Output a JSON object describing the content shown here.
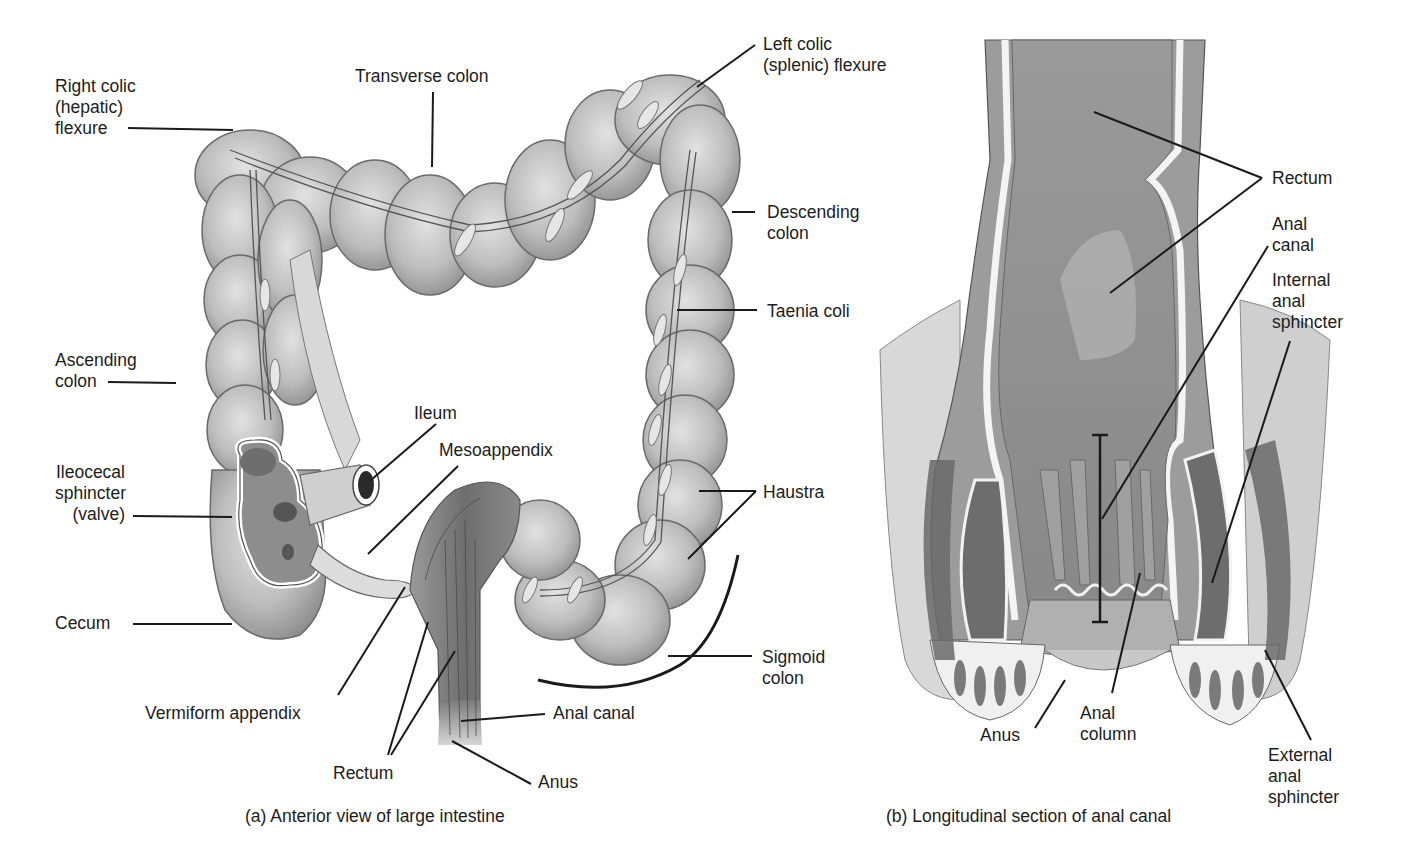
{
  "figure": {
    "panel_a": {
      "caption": "(a) Anterior view of large intestine",
      "labels": {
        "right_colic": "Right colic\n(hepatic)\nflexure",
        "transverse": "Transverse colon",
        "left_colic": "Left colic\n(splenic) flexure",
        "descending": "Descending\ncolon",
        "taenia": "Taenia coli",
        "ascending": "Ascending\ncolon",
        "ileum": "Ileum",
        "mesoappendix": "Mesoappendix",
        "ileocecal": "Ileocecal\nsphincter\n(valve)",
        "haustra": "Haustra",
        "cecum": "Cecum",
        "sigmoid": "Sigmoid\ncolon",
        "vermiform": "Vermiform appendix",
        "anal_canal": "Anal canal",
        "rectum": "Rectum",
        "anus": "Anus"
      }
    },
    "panel_b": {
      "caption": "(b) Longitudinal section of anal canal",
      "labels": {
        "rectum": "Rectum",
        "anal_canal": "Anal\ncanal",
        "internal_sphincter": "Internal\nanal\nsphincter",
        "anus": "Anus",
        "anal_column": "Anal\ncolumn",
        "external_sphincter": "External\nanal\nsphincter"
      }
    },
    "colors": {
      "tissue_light": "#c9c9c9",
      "tissue_mid": "#a8a8a8",
      "tissue_dark": "#7a7a7a",
      "outline": "#5a5a5a",
      "leader": "#1a1a1a"
    }
  }
}
